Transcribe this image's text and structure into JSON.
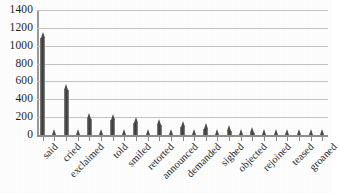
{
  "chart_data": {
    "type": "bar",
    "title": "",
    "subtitle": "",
    "xlabel": "",
    "ylabel": "",
    "ylim": [
      0,
      1400
    ],
    "ytick_step": 200,
    "yticks": [
      1400,
      1200,
      1000,
      800,
      600,
      400,
      200,
      0
    ],
    "grid": true,
    "legend": false,
    "legend_position": "none",
    "orientation": "vertical",
    "bar_color": "#4a4a4a",
    "axis_color": "#8e8e8e",
    "gridline_color": "#c5c5c5",
    "background_color": "#ffffff",
    "label_rotation": -45,
    "labels_shown_every_nth": 2,
    "categories": [
      "said",
      "asked",
      "cried",
      "replied",
      "exclaimed",
      "answered",
      "told",
      "added",
      "smiled",
      "laughed",
      "retorted",
      "observed",
      "announced",
      "remarked",
      "demanded",
      "murmured",
      "sighed",
      "muttered",
      "objected",
      "protested",
      "rejoined",
      "whispered",
      "teased",
      "snapped",
      "groaned"
    ],
    "visible_tick_labels": [
      "said",
      "cried",
      "exclaimed",
      "told",
      "smiled",
      "retorted",
      "announced",
      "demanded",
      "sighed",
      "objected",
      "rejoined",
      "teased"
    ],
    "values": [
      1150,
      30,
      570,
      25,
      250,
      20,
      230,
      20,
      200,
      20,
      180,
      18,
      160,
      16,
      140,
      14,
      110,
      12,
      90,
      10,
      70,
      10,
      55,
      8,
      45
    ]
  }
}
